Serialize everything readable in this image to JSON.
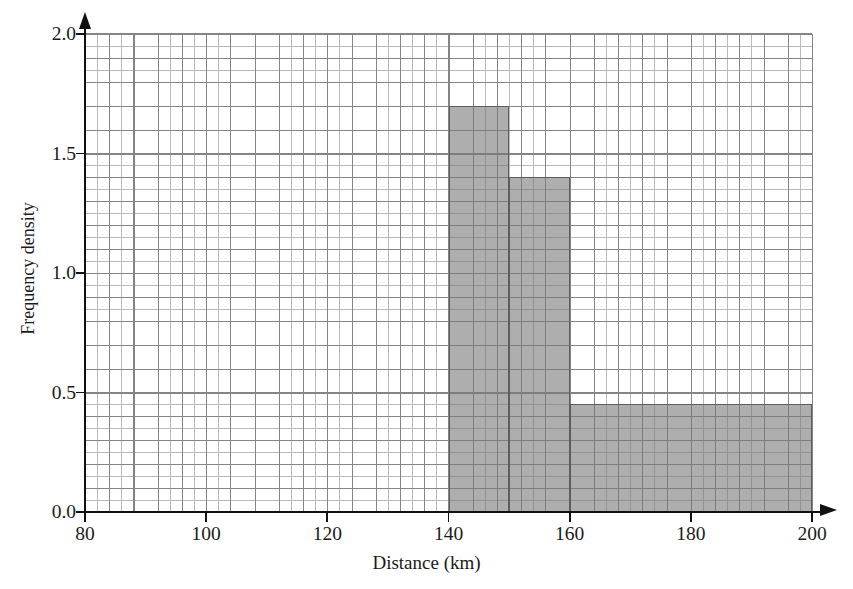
{
  "chart_data": {
    "type": "bar",
    "title": "",
    "subtitle": "",
    "xlabel": "Distance (km)",
    "ylabel": "Frequency density",
    "xlim": [
      80,
      200
    ],
    "ylim": [
      0.0,
      2.0
    ],
    "grid": true,
    "grid_minor_step_x": 2,
    "grid_minor_step_y": 0.05,
    "grid_major_step_x": 4,
    "grid_major_step_y": 0.1,
    "legend": null,
    "legend_position": "none",
    "xticks": [
      {
        "value": 80,
        "label": "80"
      },
      {
        "value": 100,
        "label": "100"
      },
      {
        "value": 120,
        "label": "120"
      },
      {
        "value": 140,
        "label": "140"
      },
      {
        "value": 160,
        "label": "160"
      },
      {
        "value": 180,
        "label": "180"
      },
      {
        "value": 200,
        "label": "200"
      }
    ],
    "yticks": [
      {
        "value": 0.0,
        "label": "0.0"
      },
      {
        "value": 0.5,
        "label": "0.5"
      },
      {
        "value": 1.0,
        "label": "1.0"
      },
      {
        "value": 1.5,
        "label": "1.5"
      },
      {
        "value": 2.0,
        "label": "2.0"
      }
    ],
    "bar_color": "#969696",
    "bar_edge_color": "#5d5d5d",
    "bars": [
      {
        "name": "bin-140-150",
        "x0": 140,
        "x1": 150,
        "height": 1.7
      },
      {
        "name": "bin-150-160",
        "x0": 150,
        "x1": 160,
        "height": 1.4
      },
      {
        "name": "bin-160-200",
        "x0": 160,
        "x1": 200,
        "height": 0.45
      }
    ],
    "categories": [
      "140-150",
      "150-160",
      "160-200"
    ],
    "values": [
      1.7,
      1.4,
      0.45
    ],
    "annotations": []
  }
}
